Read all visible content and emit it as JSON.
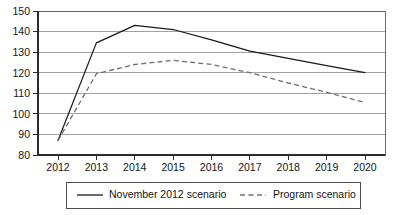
{
  "chart_data": {
    "type": "line",
    "title": "",
    "subtitle": "",
    "xlabel": "",
    "ylabel": "",
    "categories": [
      "2012",
      "2013",
      "2014",
      "2015",
      "2016",
      "2017",
      "2018",
      "2019",
      "2020"
    ],
    "x": [
      2012,
      2013,
      2014,
      2015,
      2016,
      2017,
      2018,
      2019,
      2020
    ],
    "ylim": [
      80,
      150
    ],
    "yticks": [
      80,
      90,
      100,
      110,
      120,
      130,
      140,
      150
    ],
    "ytick_labels": [
      "80",
      "90",
      "100",
      "110",
      "120",
      "130",
      "140",
      "150"
    ],
    "grid": true,
    "grid_axis": "y",
    "legend_position": "bottom",
    "series": [
      {
        "name": "November 2012 scenario",
        "style": "solid",
        "color": "#1a1a1a",
        "values": [
          87,
          134.5,
          143,
          141,
          136,
          130.5,
          127,
          123.5,
          120
        ]
      },
      {
        "name": "Program scenario",
        "style": "dashed",
        "color": "#6e6e6e",
        "values": [
          87,
          119.5,
          124,
          126,
          124,
          120,
          115,
          110.5,
          105.5
        ]
      }
    ]
  },
  "legend": {
    "entries": [
      {
        "label": "November 2012 scenario"
      },
      {
        "label": "Program scenario"
      }
    ]
  },
  "axes": {
    "y_axis_name": "value-axis",
    "x_axis_name": "year-axis"
  }
}
